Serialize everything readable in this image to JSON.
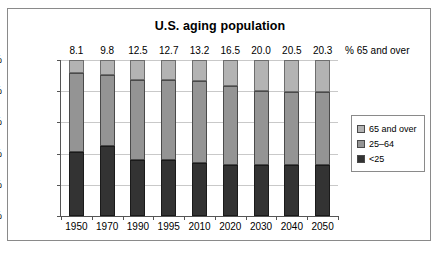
{
  "chart": {
    "title": "U.S. aging population",
    "top_label_caption": "% 65 and over"
  },
  "legend": {
    "position": "right",
    "items": [
      {
        "label": "65 and over",
        "color": "#b3b3b3"
      },
      {
        "label": "25–64",
        "color": "#949494"
      },
      {
        "label": "<25",
        "color": "#333333"
      }
    ]
  },
  "yaxis": {
    "ticks": [
      "0%",
      "20%",
      "40%",
      "60%",
      "80%",
      "100%"
    ]
  },
  "xaxis": {
    "ticks": [
      "1950",
      "1970",
      "1990",
      "1995",
      "2010",
      "2020",
      "2030",
      "2040",
      "2050"
    ]
  },
  "top_labels": [
    "8.1",
    "9.8",
    "12.5",
    "12.7",
    "13.2",
    "16.5",
    "20.0",
    "20.5",
    "20.3"
  ],
  "chart_data": {
    "type": "bar",
    "subtype": "stacked-100-percent",
    "title": "U.S. aging population",
    "xlabel": "",
    "ylabel": "",
    "ylim": [
      0,
      100
    ],
    "ytick_values": [
      0,
      20,
      40,
      60,
      80,
      100
    ],
    "grid": true,
    "legend_position": "right",
    "categories": [
      "1950",
      "1970",
      "1990",
      "1995",
      "2010",
      "2020",
      "2030",
      "2040",
      "2050"
    ],
    "series": [
      {
        "name": "<25",
        "color": "#333333",
        "values": [
          41.0,
          45.0,
          36.0,
          36.0,
          34.0,
          33.0,
          33.0,
          33.0,
          33.0
        ]
      },
      {
        "name": "25–64",
        "color": "#949494",
        "values": [
          50.9,
          45.2,
          51.5,
          51.3,
          52.8,
          50.5,
          47.0,
          46.5,
          46.7
        ]
      },
      {
        "name": "65 and over",
        "color": "#b3b3b3",
        "values": [
          8.1,
          9.8,
          12.5,
          12.7,
          13.2,
          16.5,
          20.0,
          20.5,
          20.3
        ]
      }
    ],
    "data_labels": {
      "series": "65 and over",
      "caption": "% 65 and over",
      "values": [
        8.1,
        9.8,
        12.5,
        12.7,
        13.2,
        16.5,
        20.0,
        20.5,
        20.3
      ]
    }
  }
}
